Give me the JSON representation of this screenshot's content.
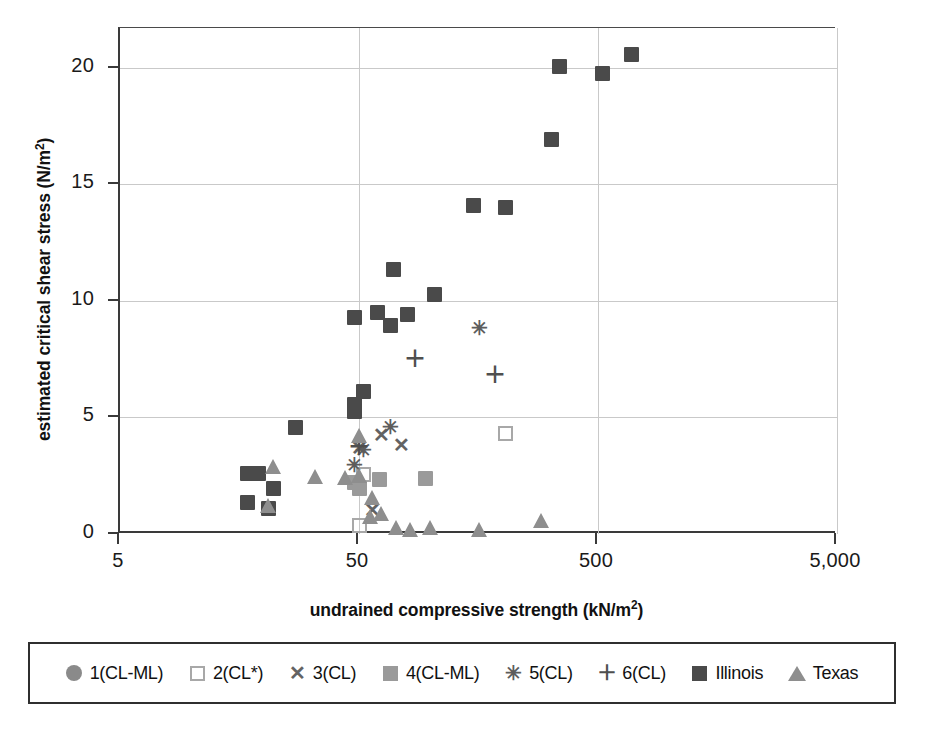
{
  "chart_data": {
    "type": "scatter",
    "title": "",
    "xlabel": "undrained compressive strength (kN/m²)",
    "ylabel": "estimated critical shear stress (N/m²)",
    "xscale": "log",
    "yscale": "linear",
    "xlim": [
      5,
      5000
    ],
    "ylim": [
      0,
      21.7
    ],
    "xticks": [
      5,
      50,
      500,
      5000
    ],
    "xticklabels": [
      "5",
      "50",
      "500",
      "5,000"
    ],
    "yticks": [
      0,
      5,
      10,
      15,
      20
    ],
    "yticklabels": [
      "0",
      "5",
      "10",
      "15",
      "20"
    ],
    "grid": true,
    "legend_position": "below-outside",
    "series": [
      {
        "name": "1(CL-ML)",
        "marker": "circle",
        "color": "#8a8a8a",
        "points": []
      },
      {
        "name": "2(CL*)",
        "marker": "open-square",
        "color": "#a8a8a8",
        "points": [
          {
            "x": 50,
            "y": 0.35
          },
          {
            "x": 52,
            "y": 2.55
          },
          {
            "x": 205,
            "y": 4.3
          }
        ]
      },
      {
        "name": "3(CL)",
        "marker": "x",
        "color": "#636363",
        "points": [
          {
            "x": 50,
            "y": 3.7
          },
          {
            "x": 62,
            "y": 4.25
          },
          {
            "x": 75,
            "y": 3.8
          },
          {
            "x": 57,
            "y": 1.05
          }
        ]
      },
      {
        "name": "4(CL-ML)",
        "marker": "filled-square",
        "color": "#9a9a9a",
        "points": [
          {
            "x": 48,
            "y": 2.2
          },
          {
            "x": 50,
            "y": 1.95
          },
          {
            "x": 61,
            "y": 2.35
          },
          {
            "x": 95,
            "y": 2.4
          }
        ]
      },
      {
        "name": "5(CL)",
        "marker": "asterisk",
        "color": "#5d5d5d",
        "points": [
          {
            "x": 48,
            "y": 2.95
          },
          {
            "x": 52,
            "y": 3.6
          },
          {
            "x": 68,
            "y": 4.6
          },
          {
            "x": 160,
            "y": 8.85
          }
        ]
      },
      {
        "name": "6(CL)",
        "marker": "plus",
        "color": "#4f4f4f",
        "points": [
          {
            "x": 50,
            "y": 3.75
          },
          {
            "x": 86,
            "y": 7.5
          },
          {
            "x": 185,
            "y": 6.8
          }
        ]
      },
      {
        "name": "Illinois",
        "marker": "filled-square",
        "color": "#4a4a4a",
        "points": [
          {
            "x": 17,
            "y": 2.6
          },
          {
            "x": 19,
            "y": 2.6
          },
          {
            "x": 22,
            "y": 1.95
          },
          {
            "x": 17,
            "y": 1.35
          },
          {
            "x": 21,
            "y": 1.1
          },
          {
            "x": 27,
            "y": 4.55
          },
          {
            "x": 48,
            "y": 5.55
          },
          {
            "x": 48,
            "y": 5.25
          },
          {
            "x": 52,
            "y": 6.1
          },
          {
            "x": 48,
            "y": 9.3
          },
          {
            "x": 60,
            "y": 9.5
          },
          {
            "x": 68,
            "y": 8.95
          },
          {
            "x": 80,
            "y": 9.4
          },
          {
            "x": 70,
            "y": 11.35
          },
          {
            "x": 103,
            "y": 10.25
          },
          {
            "x": 150,
            "y": 14.1
          },
          {
            "x": 205,
            "y": 14.0
          },
          {
            "x": 320,
            "y": 16.9
          },
          {
            "x": 345,
            "y": 20.05
          },
          {
            "x": 520,
            "y": 19.75
          },
          {
            "x": 690,
            "y": 20.55
          }
        ]
      },
      {
        "name": "Texas",
        "marker": "triangle",
        "color": "#8e8e8e",
        "points": [
          {
            "x": 22,
            "y": 2.9
          },
          {
            "x": 21,
            "y": 1.2
          },
          {
            "x": 33,
            "y": 2.45
          },
          {
            "x": 44,
            "y": 2.4
          },
          {
            "x": 50,
            "y": 4.2
          },
          {
            "x": 50,
            "y": 2.5
          },
          {
            "x": 57,
            "y": 1.55
          },
          {
            "x": 56,
            "y": 0.75
          },
          {
            "x": 62,
            "y": 0.85
          },
          {
            "x": 72,
            "y": 0.25
          },
          {
            "x": 82,
            "y": 0.2
          },
          {
            "x": 100,
            "y": 0.25
          },
          {
            "x": 160,
            "y": 0.2
          },
          {
            "x": 290,
            "y": 0.55
          }
        ]
      }
    ]
  },
  "axes": {
    "x_title": "undrained compressive strength (kN/m",
    "x_title_sup": "2",
    "x_title_tail": ")",
    "y_title": "estimated critical shear stress (N/m",
    "y_title_sup": "2",
    "y_title_tail": ")"
  },
  "legend": {
    "items": [
      {
        "label": "1(CL-ML)",
        "marker": "circle",
        "color": "#8a8a8a"
      },
      {
        "label": "2(CL*)",
        "marker": "open-square",
        "color": "#a8a8a8"
      },
      {
        "label": "3(CL)",
        "marker": "x",
        "color": "#636363",
        "glyph": "✕"
      },
      {
        "label": "4(CL-ML)",
        "marker": "filled-square",
        "color": "#9a9a9a"
      },
      {
        "label": "5(CL)",
        "marker": "asterisk",
        "color": "#5d5d5d",
        "glyph": "✳"
      },
      {
        "label": "6(CL)",
        "marker": "plus",
        "color": "#4f4f4f",
        "glyph": "＋"
      },
      {
        "label": "Illinois",
        "marker": "filled-square",
        "color": "#4a4a4a"
      },
      {
        "label": "Texas",
        "marker": "triangle",
        "color": "#8e8e8e"
      }
    ]
  },
  "colors": {
    "axis": "#3a3a3a",
    "grid": "#c9c9c9",
    "background": "#ffffff",
    "text": "#111111"
  }
}
